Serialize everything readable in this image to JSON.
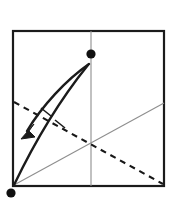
{
  "figure": {
    "kind": "origami-fold-step-diagram",
    "width": 173,
    "height": 201,
    "background_color": "#ffffff"
  },
  "step_badge": {
    "label": "③",
    "number": "3",
    "style": "circled-number",
    "color": "#2b2b2b",
    "x": 33,
    "y": 18
  },
  "paper": {
    "name": "square-sheet",
    "shape": "square",
    "stroke_color": "#1b1b1b",
    "stroke_width": 2.2,
    "fill": "#ffffff",
    "left": 13,
    "top": 31,
    "right": 164,
    "bottom": 186,
    "width": 151,
    "height": 155
  },
  "creases": {
    "vertical_center": {
      "name": "vertical-center-crease",
      "type": "solid-thin",
      "stroke_color": "#8e8e8e",
      "stroke_width": 1.1,
      "x1": 91,
      "y1": 31,
      "x2": 91,
      "y2": 186
    },
    "rising_diagonal": {
      "name": "rising-diagonal-crease",
      "type": "solid-thin",
      "stroke_color": "#8e8e8e",
      "stroke_width": 1.1,
      "x1": 14,
      "y1": 185,
      "x2": 164,
      "y2": 103
    },
    "dashed_fold": {
      "name": "dashed-fold-line",
      "type": "dashed",
      "stroke_color": "#171717",
      "stroke_width": 2.1,
      "dash_pattern": "6 5",
      "x1": 14,
      "y1": 102,
      "x2": 163,
      "y2": 184
    }
  },
  "markers": [
    {
      "name": "top-reference-dot",
      "shape": "filled-circle",
      "color": "#101010",
      "cx": 91,
      "cy": 54,
      "r": 4.6
    },
    {
      "name": "bottom-left-reference-dot",
      "shape": "filled-circle",
      "color": "#101010",
      "cx": 11,
      "cy": 193,
      "r": 4.6
    }
  ],
  "fold_edge": {
    "name": "folded-flap-edge",
    "type": "solid-curve",
    "stroke_color": "#1b1b1b",
    "stroke_width": 2.4,
    "path": "M 14 185 C 26 160, 50 112, 88 65",
    "from_point": "bottom-left-corner",
    "to_point": "top-reference-dot"
  },
  "motion_arrow": {
    "name": "fold-motion-arrow",
    "stroke_color": "#1b1b1b",
    "stroke_width": 2.4,
    "fill_color": "#1b1b1b",
    "direction": "down-left",
    "shaft_path": "M 89 64 C 66 80, 42 106, 27 131",
    "head_points": "22,137 33,126 29,131 34,136",
    "tail_x": 89,
    "tail_y": 64,
    "head_x": 22,
    "head_y": 137
  },
  "tick_marks": [
    {
      "name": "crease-tick-upper",
      "stroke_color": "#1b1b1b",
      "stroke_width": 1.6,
      "x1": 41,
      "y1": 108,
      "x2": 51,
      "y2": 116
    },
    {
      "name": "crease-tick-lower",
      "stroke_color": "#1b1b1b",
      "stroke_width": 1.6,
      "x1": 55,
      "y1": 120,
      "x2": 65,
      "y2": 128
    }
  ]
}
